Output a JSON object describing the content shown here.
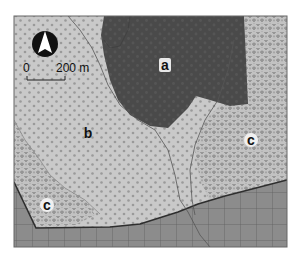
{
  "map": {
    "units": [
      {
        "id": "a",
        "label": "a",
        "description": "dark shaded polygon (north-center)",
        "color": "#4a4a4a"
      },
      {
        "id": "b",
        "label": "b",
        "description": "light gray stippled area (west-center)",
        "color": "#c8c8c8"
      },
      {
        "id": "c_east",
        "label": "c",
        "description": "light gray area with drop symbols (east)",
        "color": "#bfbfbf"
      },
      {
        "id": "c_west",
        "label": "c",
        "description": "light gray area with drop symbols (southwest)",
        "color": "#bfbfbf"
      },
      {
        "id": "grid",
        "label": "",
        "description": "gridded area (south)",
        "color": "#8a8a8a"
      }
    ],
    "north_arrow": {
      "symbol": "north-arrow"
    },
    "scale_bar": {
      "start_label": "0",
      "end_label": "200 m"
    },
    "colors": {
      "frame": "#555555",
      "dark_unit": "#4a4a4a",
      "stipple_bg": "#c9c9c9",
      "grid_bg": "#8c8c8c",
      "grid_line": "#5a5a5a",
      "boundary": "#333333"
    }
  }
}
